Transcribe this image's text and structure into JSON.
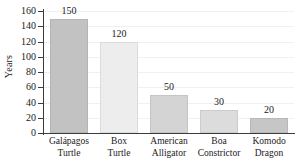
{
  "chart_data": {
    "type": "bar",
    "title": "",
    "xlabel": "",
    "ylabel": "Years",
    "categories": [
      "Galápagos Turtle",
      "Box Turtle",
      "American Alligator",
      "Boa Constrictor",
      "Komodo Dragon"
    ],
    "category_lines": [
      [
        "Galápagos",
        "Turtle"
      ],
      [
        "Box",
        "Turtle"
      ],
      [
        "American",
        "Alligator"
      ],
      [
        "Boa",
        "Constrictor"
      ],
      [
        "Komodo",
        "Dragon"
      ]
    ],
    "values": [
      150,
      120,
      50,
      30,
      20
    ],
    "value_labels": [
      "150",
      "120",
      "50",
      "30",
      "20"
    ],
    "bar_colors": [
      "#c2c2c2",
      "#ededed",
      "#d4d4d4",
      "#dcdcdc",
      "#c6c6c6"
    ],
    "ylim": [
      0,
      160
    ],
    "yticks": [
      0,
      20,
      40,
      60,
      80,
      100,
      120,
      140,
      160
    ],
    "ytick_labels": [
      "0",
      "20",
      "40",
      "60",
      "80",
      "100",
      "120",
      "140",
      "160"
    ],
    "grid": true,
    "grid_color": "#f0f0f0",
    "axis_color": "#3c3c3c",
    "legend": "none"
  },
  "axis": {
    "y_title": "Years"
  }
}
